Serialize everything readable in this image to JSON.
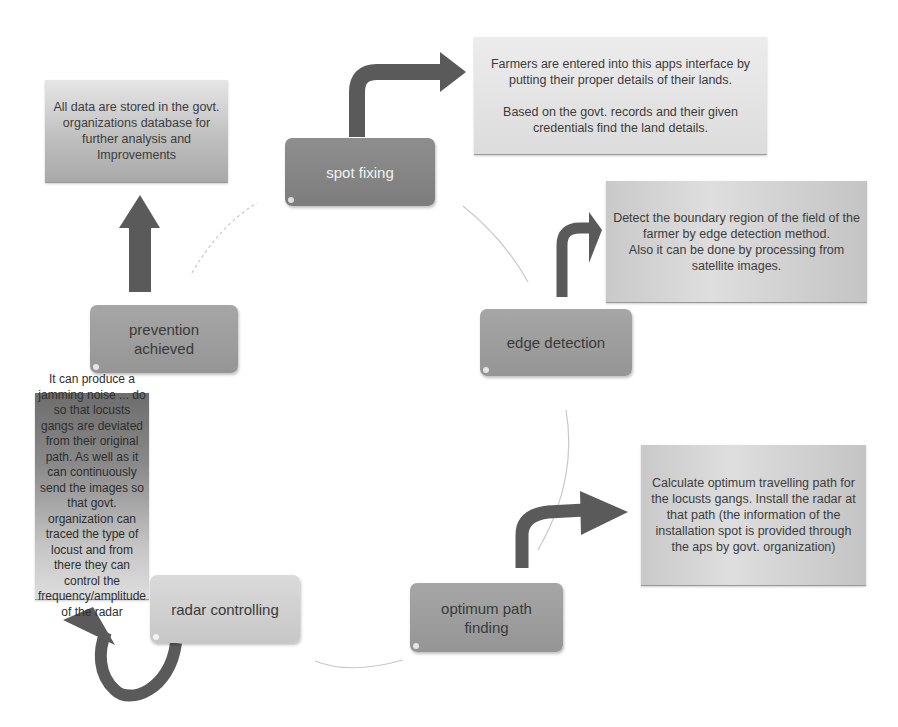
{
  "diagram": {
    "type": "cycle-process",
    "colors": {
      "arrow": "#5a5a5a",
      "node_dark": "#878787",
      "node_mid": "#9e9e9e",
      "node_light": "#d2d2d2",
      "cycle_line": "#c8c8c8"
    },
    "nodes": [
      {
        "id": "spot-fixing",
        "label": "spot fixing"
      },
      {
        "id": "edge-detection",
        "label": "edge detection"
      },
      {
        "id": "optimum-path-finding",
        "label": "optimum path finding"
      },
      {
        "id": "radar-controlling",
        "label": "radar controlling"
      },
      {
        "id": "prevention-achieved",
        "label": "prevention achieved"
      }
    ],
    "notes": {
      "spot_fixing": {
        "p1": "Farmers are entered into this apps interface by putting their proper details of their lands.",
        "p2": "Based on the govt. records and their given credentials find the land details."
      },
      "edge_detection": {
        "p1": "Detect the boundary region of the field of the farmer by edge detection method.",
        "p2": "Also it can be done by processing from satellite images."
      },
      "optimum_path": {
        "p1": "Calculate optimum travelling path for the locusts gangs. Install the radar at that path (the information of the installation spot is provided through the aps by govt. organization)"
      },
      "radar_controlling": {
        "p1": "It can produce a jamming noise ... do so that locusts gangs are deviated from their original path. As well as it can continuously send the images so that govt. organization can traced the type of locust and from there they can control the frequency/amplitude of the radar"
      },
      "prevention": {
        "p1": "All data are stored in the govt. organizations database for further analysis and Improvements"
      }
    }
  }
}
